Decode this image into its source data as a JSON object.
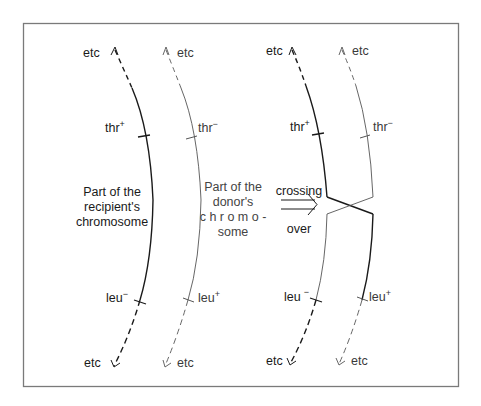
{
  "diagram": {
    "colors": {
      "frame": "#7a7a7a",
      "recipient_line": "#1a1a1a",
      "donor_line": "#555555"
    },
    "left_panel": {
      "recipient": {
        "top_label": "etc",
        "upper_marker": {
          "gene": "thr",
          "allele": "+"
        },
        "caption": [
          "Part of the",
          "recipient's",
          "chromosome"
        ],
        "lower_marker": {
          "gene": "leu",
          "allele": "−"
        },
        "bottom_label": "etc"
      },
      "donor": {
        "top_label": "etc",
        "upper_marker": {
          "gene": "thr",
          "allele": "−"
        },
        "caption": [
          "Part of the",
          "donor's",
          "c h r o m o -",
          "some"
        ],
        "lower_marker": {
          "gene": "leu",
          "allele": "+"
        },
        "bottom_label": "etc"
      }
    },
    "process": {
      "label_top": "crossing",
      "label_bottom": "over",
      "arrow": "double-arrow-right"
    },
    "right_panel": {
      "recipient": {
        "top_label": "etc",
        "upper_marker": {
          "gene": "thr",
          "allele": "+"
        },
        "lower_marker": {
          "gene": "leu",
          "allele": "−"
        },
        "bottom_label": "etc"
      },
      "donor": {
        "top_label": "etc",
        "upper_marker": {
          "gene": "thr",
          "allele": "−"
        },
        "lower_marker": {
          "gene": "leu",
          "allele": "+"
        },
        "bottom_label": "etc"
      }
    }
  }
}
